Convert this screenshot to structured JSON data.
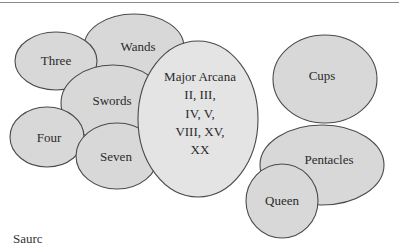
{
  "diagram": {
    "type": "overlapping-ellipses",
    "fill_color": "#d8d8d8",
    "major_fill_color": "#e4e4e4",
    "stroke_color": "#4a4a4a",
    "rule_color": "#8a8a8a",
    "nodes": [
      {
        "id": "wands",
        "label": "Wands",
        "cx": 134,
        "cy": 47,
        "rx": 50,
        "ry": 33
      },
      {
        "id": "three",
        "label": "Three",
        "cx": 56,
        "cy": 61,
        "rx": 41,
        "ry": 29
      },
      {
        "id": "cups",
        "label": "Cups",
        "cx": 325,
        "cy": 79,
        "rx": 52,
        "ry": 44
      },
      {
        "id": "swords",
        "label": "Swords",
        "cx": 113,
        "cy": 103,
        "rx": 52,
        "ry": 38
      },
      {
        "id": "four",
        "label": "Four",
        "cx": 47,
        "cy": 137,
        "rx": 37,
        "ry": 30
      },
      {
        "id": "seven",
        "label": "Seven",
        "cx": 117,
        "cy": 156,
        "rx": 41,
        "ry": 33
      },
      {
        "id": "pentacles",
        "label": "Pentacles",
        "cx": 322,
        "cy": 165,
        "rx": 62,
        "ry": 40
      },
      {
        "id": "major-arcana",
        "label_lines": [
          "Major Arcana",
          "II, III,",
          "IV, V,",
          "VIII, XV,",
          "XX"
        ],
        "cx": 198,
        "cy": 119,
        "rx": 60,
        "ry": 78
      },
      {
        "id": "queen",
        "label": "Queen",
        "cx": 282,
        "cy": 201,
        "rx": 36,
        "ry": 37
      }
    ]
  },
  "labels": {
    "wands": "Wands",
    "three": "Three",
    "cups": "Cups",
    "swords": "Swords",
    "four": "Four",
    "seven": "Seven",
    "pentacles": "Pentacles",
    "queen": "Queen",
    "major_arcana": {
      "line1": "Major Arcana",
      "line2": "II, III,",
      "line3": "IV, V,",
      "line4": "VIII, XV,",
      "line5": "XX"
    },
    "source_partial": "Saurc"
  }
}
